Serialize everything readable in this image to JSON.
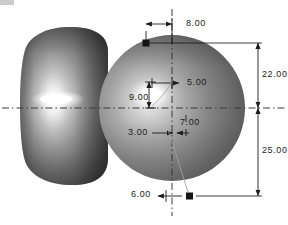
{
  "drawing": {
    "title": "Solid model with dimension annotations",
    "background_color": "#ffffff",
    "line_color": "#1c1c1c",
    "centerline_color": "#3a3a3a",
    "solid_dark": "#4a4a4a",
    "solid_mid": "#8e8e8e",
    "solid_light": "#ffffff"
  },
  "solids": [
    {
      "name": "barrel-solid",
      "shape": "rounded-barrel",
      "highlight": "specular-streak-left-of-center"
    },
    {
      "name": "sphere-solid",
      "shape": "sphere",
      "highlight": "specular-spot-upper-left"
    }
  ],
  "centerlines": [
    {
      "name": "horizontal-centerline",
      "orientation": "horizontal"
    },
    {
      "name": "vertical-centerline",
      "orientation": "vertical"
    }
  ],
  "dimensions": [
    {
      "id": "d-8",
      "value": "8.00",
      "orientation": "horizontal",
      "position": "top"
    },
    {
      "id": "d-22",
      "value": "22.00",
      "orientation": "vertical",
      "position": "right-upper"
    },
    {
      "id": "d-25",
      "value": "25.00",
      "orientation": "vertical",
      "position": "right-lower"
    },
    {
      "id": "d-5",
      "value": "5.00",
      "orientation": "horizontal",
      "position": "interior-upper"
    },
    {
      "id": "d-9",
      "value": "9.00",
      "orientation": "vertical",
      "position": "interior-left"
    },
    {
      "id": "d-3",
      "value": "3.00",
      "orientation": "horizontal",
      "position": "interior-lower-left"
    },
    {
      "id": "d-7",
      "value": "7.00",
      "orientation": "vertical",
      "position": "interior-lower-right"
    },
    {
      "id": "d-6",
      "value": "6.00",
      "orientation": "horizontal",
      "position": "bottom"
    }
  ],
  "markers": [
    {
      "name": "control-point-top",
      "style": "filled-square"
    },
    {
      "name": "control-point-bottom",
      "style": "filled-square"
    }
  ],
  "leaders": [
    {
      "name": "spline-leader-upper",
      "style": "thin-diagonal"
    },
    {
      "name": "spline-leader-lower",
      "style": "thin-curve"
    }
  ]
}
